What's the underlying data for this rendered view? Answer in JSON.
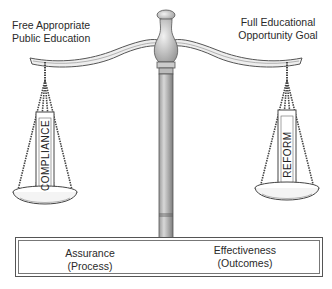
{
  "diagram": {
    "type": "balance-scale",
    "top_left_label": [
      "Free Appropriate",
      "Public Education"
    ],
    "top_right_label": [
      "Full Educational",
      "Opportunity Goal"
    ],
    "left_pan": {
      "label": "COMPLIANCE"
    },
    "right_pan": {
      "label": "REFORM"
    },
    "base": {
      "left": [
        "Assurance",
        "(Process)"
      ],
      "right": [
        "Effectiveness",
        "(Outcomes)"
      ]
    }
  }
}
